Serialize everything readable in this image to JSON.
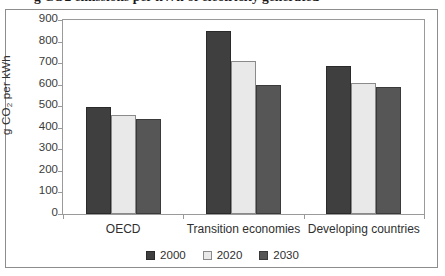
{
  "figure": {
    "title": "g CO2 emissions per kWh of electricity generated",
    "ylabel_prefix": "g CO",
    "ylabel_sub": "2",
    "ylabel_suffix": " per kWh"
  },
  "chart_data": {
    "type": "bar",
    "title": "g CO2 emissions per kWh of electricity generated",
    "xlabel": "",
    "ylabel": "g CO2 per kWh",
    "ylim": [
      0,
      900
    ],
    "yticks": [
      0,
      100,
      200,
      300,
      400,
      500,
      600,
      700,
      800,
      900
    ],
    "ytick_labels": [
      "0",
      "100",
      "200",
      "300",
      "400",
      "500",
      "600",
      "700",
      "800",
      "900"
    ],
    "grid": false,
    "legend_position": "bottom-center",
    "categories": [
      "OECD",
      "Transition economies",
      "Developing countries"
    ],
    "series": [
      {
        "name": "2000",
        "color": "#3f3f3f",
        "values": [
          495,
          850,
          685
        ]
      },
      {
        "name": "2020",
        "color": "#e9e9e9",
        "values": [
          460,
          710,
          610
        ]
      },
      {
        "name": "2030",
        "color": "#565656",
        "values": [
          440,
          600,
          590
        ]
      }
    ]
  }
}
